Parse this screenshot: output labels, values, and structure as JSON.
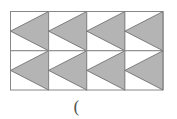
{
  "figure": {
    "rows": 2,
    "cols": 4,
    "x0": 10.5,
    "y0": 11.5,
    "x1": 163,
    "y1": 90,
    "fill_color": "#b4b4b4",
    "line_color": "#888888",
    "shape": "triangle-pointing-left"
  },
  "caption": {
    "text": "("
  }
}
